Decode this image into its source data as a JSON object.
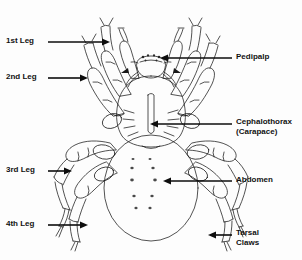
{
  "diagram": {
    "background_color": "#fdfdfd",
    "line_color": "#1a1a1a",
    "text_color": "#111111"
  },
  "labels": [
    {
      "id": "first-leg",
      "text": "1st Leg",
      "text2": "",
      "side": "left",
      "x": 6,
      "y": 36,
      "arrow": {
        "x1": 48,
        "y1": 42,
        "x2": 110,
        "y2": 42
      }
    },
    {
      "id": "second-leg",
      "text": "2nd Leg",
      "text2": "",
      "side": "left",
      "x": 6,
      "y": 72,
      "arrow": {
        "x1": 48,
        "y1": 78,
        "x2": 88,
        "y2": 78
      }
    },
    {
      "id": "pedipalp",
      "text": "Pedipalp",
      "text2": "",
      "side": "right",
      "x": 236,
      "y": 52,
      "arrow": {
        "x1": 232,
        "y1": 58,
        "x2": 160,
        "y2": 58
      }
    },
    {
      "id": "cephalothorax",
      "text": "Cephalothorax",
      "text2": "(Carapace)",
      "side": "right",
      "x": 236,
      "y": 117,
      "arrow": {
        "x1": 232,
        "y1": 124,
        "x2": 150,
        "y2": 124
      }
    },
    {
      "id": "third-leg",
      "text": "3rd Leg",
      "text2": "",
      "side": "left",
      "x": 6,
      "y": 165,
      "arrow": {
        "x1": 48,
        "y1": 171,
        "x2": 72,
        "y2": 171
      }
    },
    {
      "id": "abdomen",
      "text": "Abdomen",
      "text2": "",
      "side": "right",
      "x": 236,
      "y": 175,
      "arrow": {
        "x1": 232,
        "y1": 181,
        "x2": 163,
        "y2": 181
      }
    },
    {
      "id": "fourth-leg",
      "text": "4th Leg",
      "text2": "",
      "side": "left",
      "x": 6,
      "y": 219,
      "arrow": {
        "x1": 48,
        "y1": 225,
        "x2": 88,
        "y2": 225
      }
    },
    {
      "id": "tarsal-claws",
      "text": "Tarsal",
      "text2": "Claws",
      "side": "right",
      "x": 236,
      "y": 228,
      "arrow": {
        "x1": 232,
        "y1": 235,
        "x2": 208,
        "y2": 235
      }
    }
  ],
  "body_parts": {
    "abdomen": {
      "name": "Abdomen",
      "spot_rows": 5,
      "spots_per_row": 2
    },
    "cephalothorax": {
      "name": "Cephalothorax (Carapace)"
    },
    "legs": [
      {
        "name": "1st Leg",
        "pair": 1
      },
      {
        "name": "2nd Leg",
        "pair": 2
      },
      {
        "name": "3rd Leg",
        "pair": 3
      },
      {
        "name": "4th Leg",
        "pair": 4
      }
    ],
    "pedipalp": {
      "name": "Pedipalp",
      "count": 2
    },
    "tarsal_claws": {
      "name": "Tarsal Claws"
    },
    "chelicerae": {
      "name": "Chelicerae",
      "visible": true
    },
    "eyes": {
      "name": "Eyes",
      "visible": true
    }
  }
}
